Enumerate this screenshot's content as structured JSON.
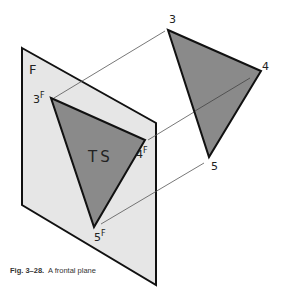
{
  "figure": {
    "caption_number": "Fig. 3–28.",
    "caption_text": "A frontal plane"
  },
  "plane": {
    "label": "F",
    "fill": "#e6e6e6",
    "stroke": "#111111"
  },
  "frontal_triangle": {
    "label": "TS",
    "fill": "#8a8a8a",
    "vertices": [
      {
        "name": "3",
        "sup": "F"
      },
      {
        "name": "4",
        "sup": "F"
      },
      {
        "name": "5",
        "sup": "F"
      }
    ]
  },
  "spatial_triangle": {
    "fill": "#8a8a8a",
    "vertices": [
      {
        "name": "3"
      },
      {
        "name": "4"
      },
      {
        "name": "5"
      }
    ]
  },
  "projection_lines": [
    {
      "from": "3F",
      "to": "3"
    },
    {
      "from": "4F",
      "to": "4"
    },
    {
      "from": "5F",
      "to": "5"
    }
  ]
}
